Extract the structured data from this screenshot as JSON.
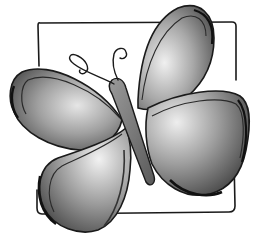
{
  "image": {
    "subject": "butterfly illustration",
    "style": "grayscale watercolor with ink outlines",
    "background": "#ffffff",
    "frame_color": "#1a1a1a",
    "wing_dark": "#3a3a3a",
    "wing_mid": "#8a8a8a",
    "wing_light": "#e8e8e8"
  }
}
